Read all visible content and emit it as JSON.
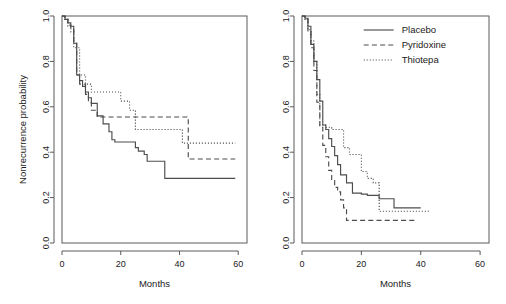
{
  "figure": {
    "background": "#ffffff",
    "line_color": "#4d4d4d",
    "frame_color": "#5a5a5a",
    "panel_count": 2
  },
  "chart_data": [
    {
      "type": "line",
      "panel": "left",
      "title": "",
      "xlabel": "Months",
      "ylabel": "Nonrecurrence probability",
      "xlim": [
        0,
        63
      ],
      "ylim": [
        0,
        1.0
      ],
      "xticks": [
        0,
        20,
        40,
        60
      ],
      "yticks": [
        0.0,
        0.2,
        0.4,
        0.6,
        0.8,
        1.0
      ],
      "xticklabels": [
        "0",
        "20",
        "40",
        "60"
      ],
      "yticklabels": [
        "0.0",
        "0.2",
        "0.4",
        "0.6",
        "0.8",
        "1.0"
      ],
      "grid": false,
      "legend": false,
      "step": "post",
      "series": [
        {
          "name": "Placebo",
          "style": "solid",
          "x": [
            0,
            1,
            2,
            3,
            4,
            5,
            6,
            7,
            8,
            9,
            10,
            12,
            14,
            16,
            17,
            18,
            22,
            25,
            26,
            28,
            29,
            34,
            35,
            59
          ],
          "y": [
            1.0,
            0.985,
            0.97,
            0.955,
            0.88,
            0.74,
            0.715,
            0.69,
            0.665,
            0.64,
            0.615,
            0.56,
            0.525,
            0.49,
            0.455,
            0.445,
            0.445,
            0.42,
            0.405,
            0.39,
            0.36,
            0.36,
            0.285,
            0.285
          ]
        },
        {
          "name": "Pyridoxine",
          "style": "dashed",
          "x": [
            0,
            1,
            2,
            3,
            4,
            5,
            6,
            8,
            9,
            10,
            12,
            42,
            43,
            59
          ],
          "y": [
            1.0,
            0.985,
            0.96,
            0.94,
            0.88,
            0.74,
            0.7,
            0.655,
            0.62,
            0.585,
            0.555,
            0.555,
            0.37,
            0.37
          ]
        },
        {
          "name": "Thiotepa",
          "style": "dotted",
          "x": [
            0,
            1,
            2,
            3,
            4,
            6,
            8,
            10,
            13,
            18,
            20,
            23,
            25,
            26,
            41,
            59
          ],
          "y": [
            1.0,
            0.985,
            0.955,
            0.93,
            0.86,
            0.74,
            0.7,
            0.665,
            0.665,
            0.665,
            0.625,
            0.585,
            0.5,
            0.5,
            0.44,
            0.44
          ]
        }
      ]
    },
    {
      "type": "line",
      "panel": "right",
      "title": "",
      "xlabel": "Months",
      "ylabel": "",
      "xlim": [
        0,
        63
      ],
      "ylim": [
        0,
        1.0
      ],
      "xticks": [
        0,
        20,
        40,
        60
      ],
      "yticks": [
        0.0,
        0.2,
        0.4,
        0.6,
        0.8,
        1.0
      ],
      "xticklabels": [
        "0",
        "20",
        "40",
        "60"
      ],
      "yticklabels": [
        "0.0",
        "0.2",
        "0.4",
        "0.6",
        "0.8",
        "1.0"
      ],
      "grid": false,
      "legend": true,
      "legend_position": "top-right",
      "step": "post",
      "series": [
        {
          "name": "Placebo",
          "style": "solid",
          "x": [
            0,
            1,
            2,
            3,
            4,
            5,
            6,
            7,
            8,
            9,
            10,
            11,
            12,
            13,
            15,
            17,
            20,
            22,
            26,
            30,
            31,
            40
          ],
          "y": [
            1.0,
            0.99,
            0.955,
            0.875,
            0.8,
            0.72,
            0.625,
            0.52,
            0.5,
            0.46,
            0.425,
            0.385,
            0.345,
            0.3,
            0.265,
            0.22,
            0.215,
            0.21,
            0.195,
            0.195,
            0.155,
            0.155
          ]
        },
        {
          "name": "Pyridoxine",
          "style": "dashed",
          "x": [
            0,
            1,
            2,
            3,
            4,
            5,
            6,
            7,
            8,
            9,
            10,
            11,
            12,
            13,
            14,
            15,
            38
          ],
          "y": [
            1.0,
            0.985,
            0.93,
            0.86,
            0.76,
            0.62,
            0.51,
            0.43,
            0.38,
            0.32,
            0.275,
            0.245,
            0.225,
            0.19,
            0.155,
            0.1,
            0.1
          ]
        },
        {
          "name": "Thiotepa",
          "style": "dotted",
          "x": [
            0,
            1,
            2,
            3,
            4,
            5,
            6,
            8,
            9,
            10,
            11,
            14,
            16,
            18,
            20,
            22,
            24,
            26,
            43
          ],
          "y": [
            1.0,
            0.985,
            0.94,
            0.89,
            0.8,
            0.655,
            0.52,
            0.51,
            0.51,
            0.5,
            0.5,
            0.42,
            0.39,
            0.39,
            0.315,
            0.285,
            0.265,
            0.14,
            0.14
          ]
        }
      ]
    }
  ],
  "legend": {
    "entries": [
      {
        "label": "Placebo",
        "style": "solid"
      },
      {
        "label": "Pyridoxine",
        "style": "dashed"
      },
      {
        "label": "Thiotepa",
        "style": "dotted"
      }
    ]
  }
}
